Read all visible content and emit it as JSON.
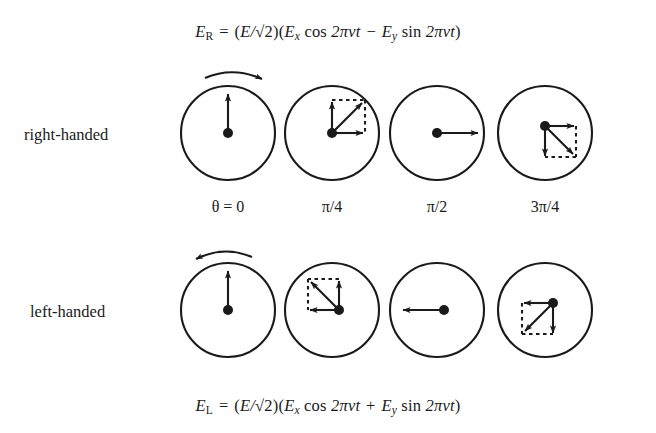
{
  "figure": {
    "type": "physics-diagram",
    "background_color": "#ffffff",
    "ink_color": "#1a1a1a"
  },
  "equations": {
    "top": {
      "id": "E_R",
      "lhs_symbol": "E",
      "lhs_subscript": "R",
      "equals": "=",
      "amplitude_open": "(",
      "amplitude_E": "E",
      "amplitude_slash": "/",
      "radical": "√",
      "radical_arg": "2",
      "amplitude_close": ")",
      "term_open": "(",
      "x_symbol": "E",
      "x_subscript": "x",
      "cos": "cos",
      "phase": "2πνt",
      "operator": "−",
      "y_symbol": "E",
      "y_subscript": "y",
      "sin": "sin",
      "term_close": ")",
      "plain_text": "E_R = (E/√2)(E_x cos 2πνt − E_y sin 2πνt)"
    },
    "bottom": {
      "id": "E_L",
      "lhs_symbol": "E",
      "lhs_subscript": "L",
      "equals": "=",
      "amplitude_open": "(",
      "amplitude_E": "E",
      "amplitude_slash": "/",
      "radical": "√",
      "radical_arg": "2",
      "amplitude_close": ")",
      "term_open": "(",
      "x_symbol": "E",
      "x_subscript": "x",
      "cos": "cos",
      "phase": "2πνt",
      "operator": "+",
      "y_symbol": "E",
      "y_subscript": "y",
      "sin": "sin",
      "term_close": ")",
      "plain_text": "E_L = (E/√2)(E_x cos 2πνt + E_y sin 2πνt)"
    }
  },
  "rows": [
    {
      "name": "right-handed",
      "label": "right-handed",
      "rotation_sense": "clockwise",
      "center_y": 133,
      "panels": [
        {
          "phase_label": "θ = 0",
          "phase_symbol": "θ",
          "phase_value": "0",
          "cx": 228,
          "resultant_angle_deg": 90,
          "components": [
            "up"
          ],
          "has_rotation_arrow": true,
          "has_dotted_box": false
        },
        {
          "phase_label": "π/4",
          "phase_value": "π/4",
          "cx": 332,
          "resultant_angle_deg": 45,
          "components": [
            "up",
            "right"
          ],
          "has_rotation_arrow": false,
          "has_dotted_box": true
        },
        {
          "phase_label": "π/2",
          "phase_value": "π/2",
          "cx": 437,
          "resultant_angle_deg": 0,
          "components": [
            "right"
          ],
          "has_rotation_arrow": false,
          "has_dotted_box": false
        },
        {
          "phase_label": "3π/4",
          "phase_value": "3π/4",
          "cx": 545,
          "resultant_angle_deg": -45,
          "components": [
            "down",
            "right"
          ],
          "has_rotation_arrow": false,
          "has_dotted_box": true
        }
      ]
    },
    {
      "name": "left-handed",
      "label": "left-handed",
      "rotation_sense": "counter-clockwise",
      "center_y": 310,
      "panels": [
        {
          "cx": 228,
          "resultant_angle_deg": 90,
          "components": [
            "up"
          ],
          "has_rotation_arrow": true,
          "has_dotted_box": false
        },
        {
          "cx": 332,
          "resultant_angle_deg": 135,
          "components": [
            "up",
            "left"
          ],
          "has_rotation_arrow": false,
          "has_dotted_box": true
        },
        {
          "cx": 437,
          "resultant_angle_deg": 180,
          "components": [
            "left"
          ],
          "has_rotation_arrow": false,
          "has_dotted_box": false
        },
        {
          "cx": 545,
          "resultant_angle_deg": 225,
          "components": [
            "down",
            "left"
          ],
          "has_rotation_arrow": false,
          "has_dotted_box": true
        }
      ]
    }
  ],
  "phase_labels": {
    "y": 198,
    "items": [
      {
        "text": "θ = 0",
        "cx": 228
      },
      {
        "text": "π/4",
        "cx": 332
      },
      {
        "text": "π/2",
        "cx": 437
      },
      {
        "text": "3π/4",
        "cx": 545
      }
    ]
  }
}
